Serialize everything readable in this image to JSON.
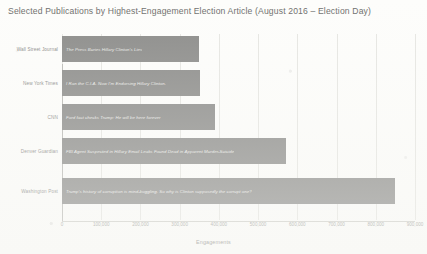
{
  "chart_data": {
    "type": "bar",
    "orientation": "horizontal",
    "title": "Selected Publications by Highest-Engagement Election Article (August 2016 – Election Day)",
    "xlabel": "Engagements",
    "ylabel": "",
    "categories": [
      "Wall Street Journal",
      "New York Times",
      "CNN",
      "Denver Guardian",
      "Washington Post"
    ],
    "values": [
      350000,
      352000,
      390000,
      570000,
      850000
    ],
    "bar_labels": [
      "The Press Buries Hillary Clinton's Lies",
      "I Ran the C.I.A. Now I'm Endorsing Hillary Clinton.",
      "Ford fact checks Trump: He will be here forever",
      "FBI Agent Suspected in Hillary Email Leaks Found Dead in Apparent Murder-Suicide",
      "Trump's history of corruption is mind-boggling. So why is Clinton supposedly the corrupt one?"
    ],
    "xlim": [
      0,
      900000
    ],
    "xticks": [
      0,
      100000,
      200000,
      300000,
      400000,
      500000,
      600000,
      700000,
      800000,
      900000
    ],
    "xtick_labels": [
      "0",
      "100,000",
      "200,000",
      "300,000",
      "400,000",
      "500,000",
      "600,000",
      "700,000",
      "800,000",
      "900,000"
    ],
    "grid": true,
    "legend": false,
    "bar_color": "#8c8c8a",
    "grid_color": "#e6e6e2",
    "background": "#fdfdfb"
  }
}
